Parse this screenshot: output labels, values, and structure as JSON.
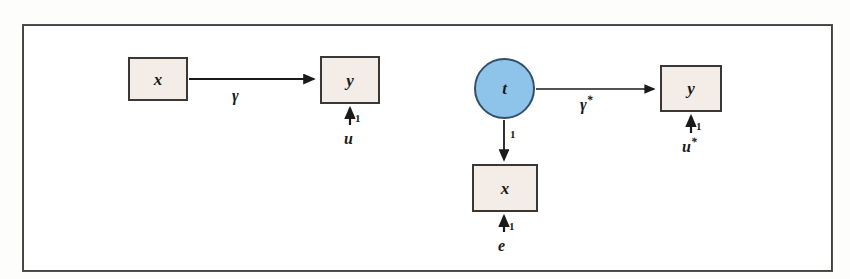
{
  "figure": {
    "background_color": "#ffffff",
    "frame_color": "#43423f",
    "box_fill": "#f4ece6",
    "box_stroke": "#3a3836",
    "circle_fill": "#8ec4ea",
    "circle_stroke": "#33506b",
    "arrow_color": "#1a1a1a"
  },
  "panels": [
    {
      "id": "left-panel",
      "name": "observed-regression",
      "nodes": [
        {
          "id": "x-left",
          "label": "x",
          "shape": "rectangle"
        },
        {
          "id": "y-left",
          "label": "y",
          "shape": "rectangle"
        },
        {
          "id": "u-left",
          "label": "u",
          "shape": "text"
        }
      ],
      "edges": [
        {
          "from": "x-left",
          "to": "y-left",
          "label": "γ",
          "direction": "right"
        },
        {
          "from": "u-left",
          "to": "y-left",
          "label": "1",
          "direction": "up"
        }
      ]
    },
    {
      "id": "right-panel",
      "name": "instrumented-regression",
      "nodes": [
        {
          "id": "t-right",
          "label": "t",
          "shape": "ellipse"
        },
        {
          "id": "x-right",
          "label": "x",
          "shape": "rectangle"
        },
        {
          "id": "y-right",
          "label": "y",
          "shape": "rectangle"
        },
        {
          "id": "e-right",
          "label": "e",
          "shape": "text"
        },
        {
          "id": "u-right",
          "label": "u*",
          "shape": "text"
        }
      ],
      "edges": [
        {
          "from": "t-right",
          "to": "y-right",
          "label": "γ*",
          "direction": "right"
        },
        {
          "from": "t-right",
          "to": "x-right",
          "label": "1",
          "direction": "down"
        },
        {
          "from": "e-right",
          "to": "x-right",
          "label": "1",
          "direction": "up"
        },
        {
          "from": "u-right",
          "to": "y-right",
          "label": "1",
          "direction": "up"
        }
      ]
    }
  ],
  "labels": {
    "x": "x",
    "y": "y",
    "t": "t",
    "u": "u",
    "e": "e",
    "gamma": "γ",
    "gamma_star_base": "γ",
    "gamma_star_sup": "*",
    "u_star_base": "u",
    "u_star_sup": "*",
    "one": "1"
  }
}
